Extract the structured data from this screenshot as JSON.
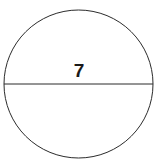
{
  "figure": {
    "kind": "geometry-diagram",
    "background_color": "#ffffff",
    "canvas": {
      "width": 158,
      "height": 163
    },
    "circle": {
      "name": "circle-outline",
      "center_x": 78.5,
      "center_y": 84,
      "radius_x": 74.5,
      "radius_y": 74,
      "stroke_color": "#2b2b2b",
      "stroke_width": 1,
      "fill_color": "#ffffff"
    },
    "diameter": {
      "name": "diameter-line",
      "x1": 4,
      "y1": 84,
      "x2": 153,
      "y2": 84,
      "stroke_color": "#2b2b2b",
      "stroke_width": 1
    },
    "labels": [
      {
        "name": "diameter-measure-label",
        "text": "7",
        "value": 7,
        "refers_to": "diameter",
        "color": "#1a1a1a",
        "x": 79,
        "y": 71
      }
    ]
  }
}
